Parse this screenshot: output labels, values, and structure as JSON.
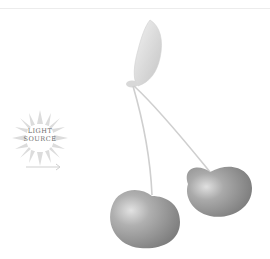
{
  "illustration": {
    "subject": "pair of cherries with leaf",
    "light_source": {
      "label_line1": "LIGHT",
      "label_line2": "SOURCE",
      "icon": "sun-icon",
      "arrow_icon": "arrow-right-icon"
    },
    "colors": {
      "background": "#ffffff",
      "cherry": "#8e8e8e",
      "cherry_highlight": "#d6d6d6",
      "leaf": "#d9d9d9",
      "stem": "#c8c8c8",
      "sun_rays": "#dcdcdc",
      "label_text": "#6b6b6b"
    }
  }
}
